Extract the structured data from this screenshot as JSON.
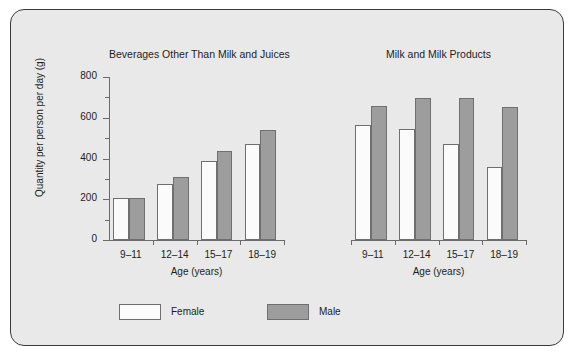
{
  "axis": {
    "ylabel": "Quantity per person per day (g)",
    "xlabel": "Age (years)",
    "yticks": [
      "0",
      "200",
      "400",
      "600",
      "800"
    ],
    "ymin": 0,
    "ymax": 800
  },
  "legend": {
    "items": [
      {
        "label": "Female",
        "color": "#fbfbfb"
      },
      {
        "label": "Male",
        "color": "#9d9d9d"
      }
    ]
  },
  "chart_data": [
    {
      "type": "bar",
      "title": "Beverages Other Than Milk and Juices",
      "xlabel": "Age (years)",
      "ylabel": "Quantity per person per day (g)",
      "categories": [
        "9–11",
        "12–14",
        "15–17",
        "18–19"
      ],
      "ylim": [
        0,
        800
      ],
      "yticks": [
        0,
        200,
        400,
        600,
        800
      ],
      "grid": false,
      "legend_position": "bottom",
      "series": [
        {
          "name": "Female",
          "color": "#fbfbfb",
          "values": [
            205,
            275,
            390,
            470
          ]
        },
        {
          "name": "Male",
          "color": "#9d9d9d",
          "values": [
            205,
            310,
            435,
            540
          ]
        }
      ]
    },
    {
      "type": "bar",
      "title": "Milk and Milk Products",
      "xlabel": "Age (years)",
      "ylabel": "Quantity per person per day (g)",
      "categories": [
        "9–11",
        "12–14",
        "15–17",
        "18–19"
      ],
      "ylim": [
        0,
        800
      ],
      "yticks": [
        0,
        200,
        400,
        600,
        800
      ],
      "grid": false,
      "legend_position": "bottom",
      "series": [
        {
          "name": "Female",
          "color": "#fbfbfb",
          "values": [
            565,
            545,
            470,
            360
          ]
        },
        {
          "name": "Male",
          "color": "#9d9d9d",
          "values": [
            660,
            695,
            695,
            655
          ]
        }
      ]
    }
  ]
}
